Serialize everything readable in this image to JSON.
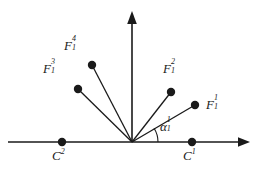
{
  "figure": {
    "type": "vector-diagram",
    "background_color": "#ffffff",
    "stroke_color": "#1a1a1a",
    "origin": {
      "x": 132,
      "y": 142
    },
    "axes": {
      "x_axis": {
        "from_x": 8,
        "to_x": 250,
        "y": 142,
        "arrow": "right"
      },
      "y_axis": {
        "x": 132,
        "from_y": 142,
        "to_y": 12,
        "arrow": "up"
      }
    },
    "vectors": [
      {
        "label_base": "F",
        "label_sub": "1",
        "label_sup": "1",
        "tip": {
          "x": 195,
          "y": 105
        },
        "label_pos": {
          "x": 206,
          "y": 96
        }
      },
      {
        "label_base": "F",
        "label_sub": "1",
        "label_sup": "2",
        "tip": {
          "x": 171,
          "y": 92
        },
        "label_pos": {
          "x": 163,
          "y": 60
        }
      },
      {
        "label_base": "F",
        "label_sub": "1",
        "label_sup": "3",
        "tip": {
          "x": 78,
          "y": 89
        },
        "label_pos": {
          "x": 43,
          "y": 60
        }
      },
      {
        "label_base": "F",
        "label_sub": "1",
        "label_sup": "4",
        "tip": {
          "x": 92,
          "y": 65
        },
        "label_pos": {
          "x": 64,
          "y": 37
        }
      }
    ],
    "angle": {
      "label_base": "α",
      "label_sub": "1",
      "label_sup": "1",
      "label_pos": {
        "x": 160,
        "y": 118
      },
      "arc_radius": 26,
      "between": [
        "x-axis",
        "F_1^1"
      ]
    },
    "axis_points": [
      {
        "label_base": "C",
        "label_sup": "2",
        "point": {
          "x": 62,
          "y": 142
        },
        "label_pos": {
          "x": 52,
          "y": 147
        }
      },
      {
        "label_base": "C",
        "label_sup": "1",
        "point": {
          "x": 192,
          "y": 142
        },
        "label_pos": {
          "x": 183,
          "y": 147
        }
      }
    ]
  }
}
